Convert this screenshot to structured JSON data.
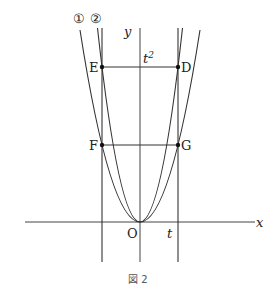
{
  "figure": {
    "caption": "図 2",
    "axes": {
      "x_label": "x",
      "y_label": "y",
      "origin_label": "O"
    },
    "x_tick_label": "t",
    "y_tick_label": "t",
    "y_tick_sup": "2",
    "curves": [
      {
        "id": "curve-1",
        "marker": "①",
        "description": "wider parabola through F and G"
      },
      {
        "id": "curve-2",
        "marker": "②",
        "description": "narrower parabola through E and D"
      }
    ],
    "points": [
      {
        "name": "E",
        "label": "E"
      },
      {
        "name": "D",
        "label": "D"
      },
      {
        "name": "F",
        "label": "F"
      },
      {
        "name": "G",
        "label": "G"
      }
    ],
    "colors": {
      "line": "#333333",
      "text": "#222222"
    }
  }
}
